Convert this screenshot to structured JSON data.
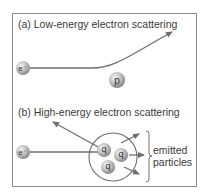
{
  "panel_a": {
    "title": "(a) Low-energy electron scattering",
    "electron_label": "e⁻",
    "proton_label": "p"
  },
  "panel_b": {
    "title": "(b) High-energy electron scattering",
    "electron_label": "e⁻",
    "quarks": [
      "q",
      "q",
      "q"
    ],
    "bracket_label_line1": "emitted",
    "bracket_label_line2": "particles"
  },
  "colors": {
    "frame": "#8a8a8a",
    "line": "#6f6f6f",
    "particle": "#b8b8b8",
    "text": "#3a3a3a"
  }
}
